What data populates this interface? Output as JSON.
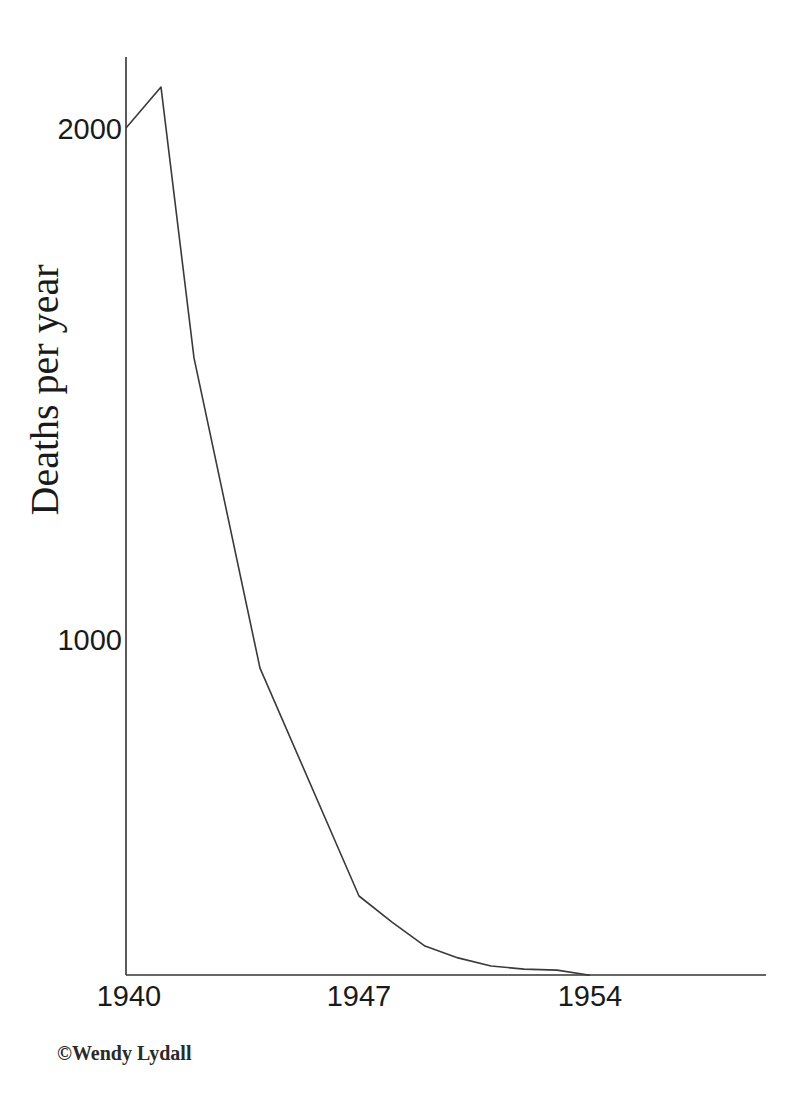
{
  "chart_data": {
    "type": "line",
    "title": "",
    "xlabel": "",
    "ylabel": "Deaths per year",
    "x": [
      1940,
      1941,
      1942,
      1944,
      1947,
      1948,
      1949,
      1950,
      1951,
      1952,
      1953,
      1954
    ],
    "series": [
      {
        "name": "Deaths per year",
        "values": [
          2000,
          2080,
          1550,
          943,
          497,
          446,
          399,
          376,
          360,
          354,
          352,
          342
        ]
      }
    ],
    "x_ticks": [
      1940,
      1947,
      1954
    ],
    "x_tick_labels": [
      "1940",
      "1947",
      "1954"
    ],
    "y_ticks": [
      1000,
      2000
    ],
    "y_tick_labels": [
      "1000",
      "2000"
    ],
    "xlim": [
      1940,
      1959.5
    ],
    "ylim": [
      342,
      2139
    ],
    "grid": false,
    "legend": "none"
  },
  "credit": "©Wendy Lydall",
  "colors": {
    "line": "#3a3a3a",
    "axis": "#333333",
    "background": "#ffffff"
  }
}
